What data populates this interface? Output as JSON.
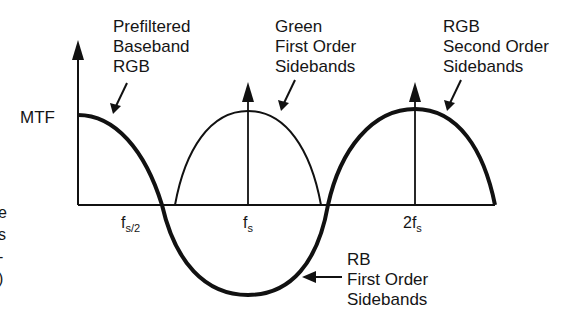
{
  "diagram": {
    "y_axis_label": "MTF",
    "x_ticks": [
      {
        "main": "f",
        "sub": "s/2",
        "x": 162
      },
      {
        "main": "f",
        "sub": "s",
        "x": 248
      },
      {
        "prefix": "2",
        "main": "f",
        "sub": "s",
        "x": 415
      }
    ],
    "annotations": {
      "baseband": [
        "Prefiltered",
        "Baseband",
        "RGB"
      ],
      "green_first": [
        "Green",
        "First Order",
        "Sidebands"
      ],
      "rgb_second": [
        "RGB",
        "Second Order",
        "Sidebands"
      ],
      "rb_first": [
        "RB",
        "First Order",
        "Sidebands"
      ]
    },
    "left_edge_fragments": [
      "e",
      "s",
      "-",
      ")"
    ],
    "colors": {
      "line": "#111111",
      "background": "#ffffff"
    }
  }
}
